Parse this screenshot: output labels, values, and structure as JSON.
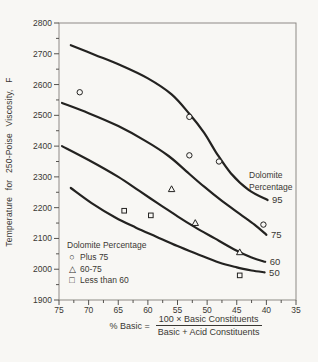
{
  "page": {
    "bg": "#f8f7f4",
    "ink": "#232220",
    "text": "#3a3833",
    "frame": "#8d8a85",
    "tick": "#55534f"
  },
  "chart_data": {
    "type": "line",
    "title": "",
    "ylabel": "Temperature for 250-Poise Viscosity, F",
    "x_axis": {
      "label_prefix": "% Basic =",
      "numerator": "100 × Basic Constituents",
      "denominator": "Basic + Acid Constituents",
      "domain": [
        75,
        35
      ],
      "reversed": true,
      "ticks": [
        75,
        70,
        65,
        60,
        55,
        50,
        45,
        40,
        35
      ],
      "minor_step": 2.5
    },
    "y_axis": {
      "domain": [
        1900,
        2800
      ],
      "ticks": [
        2800,
        2700,
        2600,
        2500,
        2400,
        2300,
        2200,
        2100,
        2000,
        1900
      ],
      "minor_step": 50
    },
    "right_label": {
      "line1": "Dolomite",
      "line2": "Percentage"
    },
    "legend": {
      "title": "Dolomite Percentage"
    },
    "curves": [
      {
        "label": "95",
        "points": [
          [
            73,
            2728
          ],
          [
            69,
            2697
          ],
          [
            64.5,
            2662
          ],
          [
            60,
            2620
          ],
          [
            56,
            2568
          ],
          [
            53,
            2505
          ],
          [
            50.5,
            2443
          ],
          [
            48.5,
            2380
          ],
          [
            46,
            2312
          ],
          [
            43,
            2258
          ],
          [
            39.8,
            2225
          ]
        ]
      },
      {
        "label": "75",
        "points": [
          [
            74.5,
            2540
          ],
          [
            70,
            2507
          ],
          [
            65,
            2465
          ],
          [
            60.5,
            2418
          ],
          [
            56.5,
            2368
          ],
          [
            53.5,
            2318
          ],
          [
            50.5,
            2268
          ],
          [
            47.5,
            2222
          ],
          [
            44.5,
            2180
          ],
          [
            42,
            2145
          ],
          [
            40,
            2112
          ]
        ]
      },
      {
        "label": "60",
        "points": [
          [
            74.5,
            2400
          ],
          [
            70,
            2355
          ],
          [
            65,
            2300
          ],
          [
            61.5,
            2255
          ],
          [
            58.3,
            2214
          ],
          [
            55,
            2172
          ],
          [
            52,
            2136
          ],
          [
            48.7,
            2100
          ],
          [
            45.5,
            2065
          ],
          [
            42.5,
            2038
          ],
          [
            40.2,
            2024
          ]
        ]
      },
      {
        "label": "50",
        "points": [
          [
            73,
            2264
          ],
          [
            69.5,
            2215
          ],
          [
            65.5,
            2168
          ],
          [
            62,
            2135
          ],
          [
            58.5,
            2105
          ],
          [
            55,
            2075
          ],
          [
            51.5,
            2048
          ],
          [
            48,
            2022
          ],
          [
            45,
            2006
          ],
          [
            42.5,
            1996
          ],
          [
            40.3,
            1990
          ]
        ]
      }
    ],
    "scatter": [
      {
        "symbol": "circle",
        "glyph": "○",
        "legend": "Plus 75",
        "points": [
          [
            71.5,
            2575
          ],
          [
            53,
            2495
          ],
          [
            53,
            2370
          ],
          [
            48,
            2350
          ],
          [
            40.5,
            2145
          ]
        ]
      },
      {
        "symbol": "triangle",
        "glyph": "△",
        "legend": "60-75",
        "points": [
          [
            56,
            2260
          ],
          [
            52,
            2150
          ],
          [
            44.5,
            2055
          ]
        ]
      },
      {
        "symbol": "square",
        "glyph": "□",
        "legend": "Less than 60",
        "points": [
          [
            64,
            2190
          ],
          [
            59.5,
            2175
          ],
          [
            44.5,
            1980
          ]
        ]
      }
    ]
  }
}
